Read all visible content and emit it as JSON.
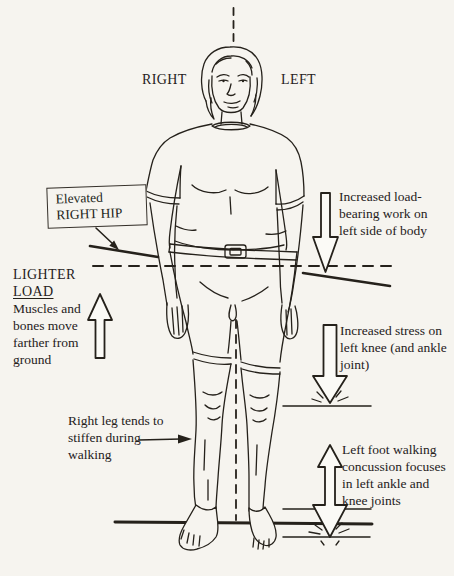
{
  "colors": {
    "paper": "#f6f4ef",
    "ink": "#25211b"
  },
  "orientation_labels": {
    "right": "RIGHT",
    "left": "LEFT"
  },
  "annotations": {
    "elevated_hip": {
      "line1": "Elevated",
      "line2": "RIGHT HIP"
    },
    "load_bearing": {
      "lines": [
        "Increased load-",
        "bearing work on",
        "left side of body"
      ]
    },
    "lighter_load": {
      "heading1": "LIGHTER",
      "heading2": "LOAD",
      "body": [
        "Muscles and",
        "bones move",
        "farther from",
        "ground"
      ]
    },
    "knee_stress": {
      "lines": [
        "Increased stress on",
        "left knee (and ankle",
        "joint)"
      ]
    },
    "stiff_leg": {
      "lines": [
        "Right leg tends to",
        "stiffen during",
        "walking"
      ]
    },
    "foot_concussion": {
      "lines": [
        "Left foot walking",
        "concussion focuses",
        "in left ankle and",
        "knee joints"
      ]
    }
  },
  "arrows": {
    "lighter_load": "hollow-arrow-up",
    "load_bearing": "hollow-arrow-down",
    "knee_stress": "hollow-arrow-down",
    "foot_concussion": "hollow-arrow-double-vertical",
    "hip_pointer": "thin-arrow-down-right",
    "leg_pointer": "thin-arrow-right"
  }
}
